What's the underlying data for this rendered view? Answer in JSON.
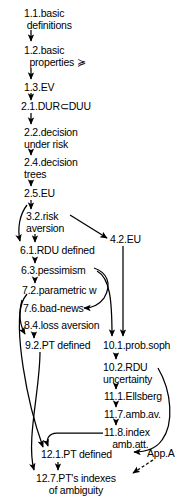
{
  "diagram": {
    "background_color": "#ffffff",
    "line_color": "#000000",
    "nodes": [
      {
        "id": "n1_1",
        "label": "1.1.basic\n definitions",
        "x": 24,
        "y": 8,
        "align": "left"
      },
      {
        "id": "n1_2",
        "label": "1.2.basic\n  properties ≽",
        "x": 24,
        "y": 45,
        "align": "left"
      },
      {
        "id": "n1_3",
        "label": "1.3.EV",
        "x": 24,
        "y": 82,
        "align": "left"
      },
      {
        "id": "n2_1",
        "label": "2.1.DUR⊂DUU",
        "x": 21,
        "y": 101,
        "align": "left"
      },
      {
        "id": "n2_2",
        "label": "2.2.decision\nunder risk",
        "x": 24,
        "y": 127,
        "align": "left"
      },
      {
        "id": "n2_4",
        "label": "2.4.decision\ntrees",
        "x": 24,
        "y": 157,
        "align": "left"
      },
      {
        "id": "n2_5",
        "label": "2.5.EU",
        "x": 24,
        "y": 188,
        "align": "left"
      },
      {
        "id": "n3_2",
        "label": "3.2.risk\naversion",
        "x": 26,
        "y": 211,
        "align": "left"
      },
      {
        "id": "n4_2",
        "label": "4.2.EU",
        "x": 110,
        "y": 234,
        "align": "left"
      },
      {
        "id": "n6_1",
        "label": "6.1.RDU defined",
        "x": 20,
        "y": 245,
        "align": "left"
      },
      {
        "id": "n6_3",
        "label": "6.3.pessimism",
        "x": 21,
        "y": 265,
        "align": "left"
      },
      {
        "id": "n7_2",
        "label": "7.2.parametric w",
        "x": 22,
        "y": 285,
        "align": "left"
      },
      {
        "id": "n7_6",
        "label": "7.6.bad-news",
        "x": 23,
        "y": 303,
        "align": "left"
      },
      {
        "id": "n8_4",
        "label": "8.4.loss aversion",
        "x": 24,
        "y": 320,
        "align": "left"
      },
      {
        "id": "n9_2",
        "label": "9.2.PT defined",
        "x": 25,
        "y": 340,
        "align": "left"
      },
      {
        "id": "n10_1",
        "label": "10.1.prob.soph",
        "x": 103,
        "y": 340,
        "align": "left"
      },
      {
        "id": "n10_2",
        "label": "10.2.RDU\nuncertainty",
        "x": 103,
        "y": 362,
        "align": "left"
      },
      {
        "id": "n11_1",
        "label": "11.1.Ellsberg",
        "x": 104,
        "y": 391,
        "align": "left"
      },
      {
        "id": "n11_7",
        "label": "11.7.amb.av.",
        "x": 104,
        "y": 409,
        "align": "left"
      },
      {
        "id": "n11_8",
        "label": "11.8.index\n   amb.att.",
        "x": 104,
        "y": 427,
        "align": "left"
      },
      {
        "id": "n12_1",
        "label": "12.1.PT defined",
        "x": 41,
        "y": 449,
        "align": "left"
      },
      {
        "id": "appA",
        "label": "App.A",
        "x": 147,
        "y": 448,
        "align": "left"
      },
      {
        "id": "n12_7",
        "label": "12.7.PT's indexes\nof ambiguity",
        "x": 36,
        "y": 473,
        "align": "left"
      }
    ],
    "edges": [
      {
        "from": "n1_1",
        "to": "n1_2",
        "style": "solid"
      },
      {
        "from": "n1_2",
        "to": "n1_3",
        "style": "solid"
      },
      {
        "from": "n1_3",
        "to": "n2_1",
        "style": "solid"
      },
      {
        "from": "n2_1",
        "to": "n2_2",
        "style": "solid"
      },
      {
        "from": "n2_2",
        "to": "n2_4",
        "style": "solid"
      },
      {
        "from": "n2_4",
        "to": "n2_5",
        "style": "solid"
      },
      {
        "from": "n2_5",
        "to": "n3_2",
        "style": "solid"
      },
      {
        "from": "n2_5",
        "to": "n6_1",
        "style": "solid"
      },
      {
        "from": "n3_2",
        "to": "n6_1",
        "style": "solid"
      },
      {
        "from": "n3_2",
        "to": "n4_2",
        "style": "solid"
      },
      {
        "from": "n4_2",
        "to": "n10_1",
        "style": "solid"
      },
      {
        "from": "n6_1",
        "to": "n6_3",
        "style": "solid"
      },
      {
        "from": "n6_3",
        "to": "n7_2",
        "style": "solid"
      },
      {
        "from": "n6_3",
        "to": "n7_6",
        "style": "solid"
      },
      {
        "from": "n6_3",
        "to": "n10_1",
        "style": "solid"
      },
      {
        "from": "n8_4",
        "to": "n9_2",
        "style": "solid"
      },
      {
        "from": "n7_2",
        "to": "n9_2",
        "style": "solid"
      },
      {
        "from": "n7_2",
        "to": "n12_1",
        "style": "solid"
      },
      {
        "from": "n9_2",
        "to": "n12_7",
        "style": "solid"
      },
      {
        "from": "n10_1",
        "to": "n10_2",
        "style": "solid"
      },
      {
        "from": "n10_2",
        "to": "n11_1",
        "style": "solid"
      },
      {
        "from": "n10_2",
        "to": "n12_1",
        "style": "solid"
      },
      {
        "from": "n11_1",
        "to": "n11_7",
        "style": "solid"
      },
      {
        "from": "n11_7",
        "to": "n11_8",
        "style": "solid"
      },
      {
        "from": "n11_8",
        "to": "n12_1",
        "style": "solid"
      },
      {
        "from": "n12_1",
        "to": "n12_7",
        "style": "solid"
      },
      {
        "from": "appA",
        "to": "n12_7",
        "style": "dashed"
      }
    ]
  }
}
